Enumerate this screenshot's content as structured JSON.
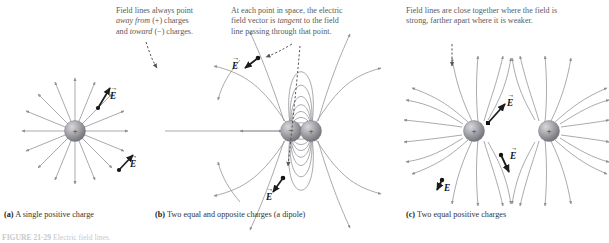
{
  "figure": {
    "number": "FIGURE 21-29",
    "caption_tail": "Electric field lines.",
    "background": "#ffffff",
    "line_color": "#8d8d94",
    "sphere_color": "#9a9a9e",
    "text_color": "#5b5b5b"
  },
  "annotations": [
    {
      "id": "note-a",
      "lines": [
        "Field lines always point",
        "away from (+) charges",
        "and toward (−) charges."
      ],
      "italic_words": [
        "away from",
        "toward"
      ]
    },
    {
      "id": "note-b",
      "lines": [
        "At each point in space, the electric",
        "field vector is tangent to the field",
        "line passing through that point."
      ],
      "italic_words": [
        "tangent"
      ]
    },
    {
      "id": "note-c",
      "lines": [
        "Field lines are close together where the field is",
        "strong, farther apart where it is weaker."
      ],
      "italic_words": []
    }
  ],
  "panels": [
    {
      "id": "panel-a",
      "letter": "(a)",
      "caption": "A single positive charge",
      "charges": [
        {
          "sign": "+",
          "label": "+"
        }
      ],
      "vector_labels": [
        "E",
        "E"
      ]
    },
    {
      "id": "panel-b",
      "letter": "(b)",
      "caption": "Two equal and opposite charges (a dipole)",
      "charges": [
        {
          "sign": "-",
          "label": "−"
        },
        {
          "sign": "+",
          "label": "+"
        }
      ],
      "vector_labels": [
        "E",
        "E"
      ]
    },
    {
      "id": "panel-c",
      "letter": "(c)",
      "caption": "Two equal positive charges",
      "charges": [
        {
          "sign": "+",
          "label": "+"
        },
        {
          "sign": "+",
          "label": "+"
        }
      ],
      "vector_labels": [
        "E",
        "E",
        "E"
      ]
    }
  ],
  "vector_arrow_glyph": "→",
  "vector_symbol": "E"
}
